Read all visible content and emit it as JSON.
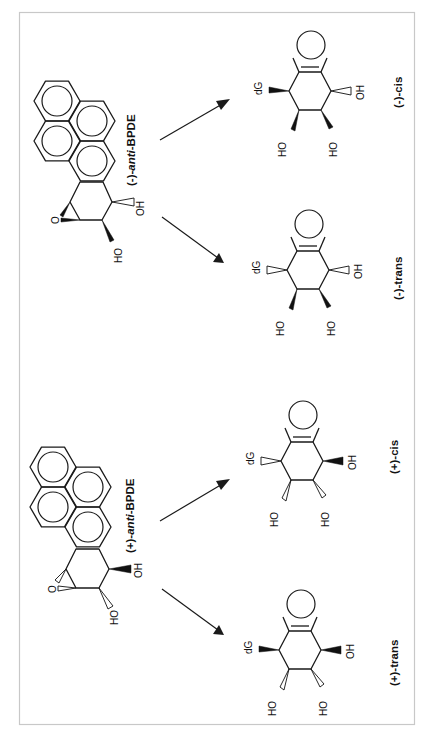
{
  "figure": {
    "type": "chemical reaction scheme",
    "orientation": "rotated 90 degrees (text reads bottom-to-top)",
    "frame_color": "#c8c8c8",
    "line_color": "#1a1a1a"
  },
  "reactions": [
    {
      "reactant": {
        "label_prefix": "(-)-",
        "label_italic": "anti",
        "label_suffix": "-BPDE",
        "atoms": {
          "epoxide_o": "O",
          "oh_top": "OH",
          "oh_bottom": "HO"
        }
      },
      "products": [
        {
          "label": "(-)-cis",
          "atoms": {
            "dG": "dG",
            "oh_right": "OH",
            "ho_left": "HO",
            "ho_right": "HO"
          }
        },
        {
          "label": "(-)-trans",
          "atoms": {
            "dG": "dG",
            "oh_right": "OH",
            "ho_left": "HO",
            "ho_right": "HO"
          }
        }
      ]
    },
    {
      "reactant": {
        "label_prefix": "(+)-",
        "label_italic": "anti",
        "label_suffix": "-BPDE",
        "atoms": {
          "epoxide_o": "O",
          "oh_top": "OH",
          "oh_bottom": "HO"
        }
      },
      "products": [
        {
          "label": "(+)-cis",
          "atoms": {
            "dG": "dG",
            "oh_right": "OH",
            "ho_left": "HO",
            "ho_right": "HO"
          }
        },
        {
          "label": "(+)-trans",
          "atoms": {
            "dG": "dG",
            "oh_right": "OH",
            "ho_left": "HO",
            "ho_right": "HO"
          }
        }
      ]
    }
  ]
}
